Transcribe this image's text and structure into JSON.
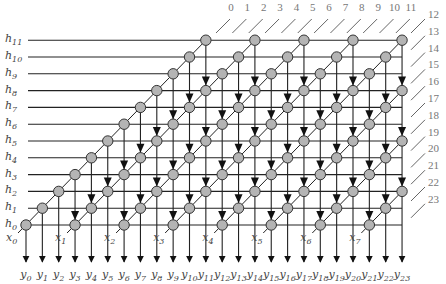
{
  "diagram": {
    "title": "",
    "type": "systolic-array-convolution",
    "h_labels": [
      "h0",
      "h1",
      "h2",
      "h3",
      "h4",
      "h5",
      "h6",
      "h7",
      "h8",
      "h9",
      "h10",
      "h11"
    ],
    "x_labels": [
      "x0",
      "x1",
      "x2",
      "x3",
      "x4",
      "x5",
      "x6",
      "x7"
    ],
    "y_labels": [
      "y0",
      "y1",
      "y2",
      "y3",
      "y4",
      "y5",
      "y6",
      "y7",
      "y8",
      "y9",
      "y10",
      "y11",
      "y12",
      "y13",
      "y14",
      "y15",
      "y16",
      "y17",
      "y18",
      "y19",
      "y20",
      "y21",
      "y22",
      "y23"
    ],
    "top_index_labels": [
      "0",
      "1",
      "2",
      "3",
      "4",
      "5",
      "6",
      "7",
      "8",
      "9",
      "10",
      "11"
    ],
    "right_index_labels": [
      "12",
      "13",
      "14",
      "15",
      "16",
      "17",
      "18",
      "19",
      "20",
      "21",
      "22",
      "23"
    ],
    "rows": 12,
    "cols": 24,
    "x_stride": 3,
    "colors": {
      "line": "#222222",
      "node_fill": "#b4b4b4",
      "node_stroke": "#333333",
      "tick": "#555555",
      "label": "#444444",
      "index_label": "#777777"
    }
  }
}
